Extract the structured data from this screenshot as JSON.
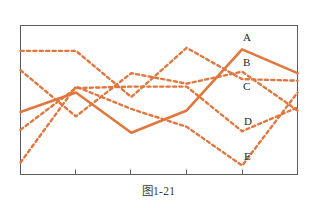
{
  "figure": {
    "caption": "图1-21",
    "line_color": "#e0773e",
    "frame_color": "#5a5a66",
    "background": "#ffffff"
  },
  "chart_data": {
    "type": "line",
    "title": "",
    "subtitle": "",
    "xlabel": "",
    "ylabel": "",
    "grid": false,
    "legend_position": "inline-right",
    "axis_frame": true,
    "xlim": [
      0,
      5
    ],
    "ylim": [
      0,
      10
    ],
    "x": [
      0,
      1,
      2,
      3,
      4,
      5
    ],
    "xtick_labels": [
      "",
      "",
      "",
      "",
      "",
      ""
    ],
    "ytick_labels": [],
    "annotations": [
      {
        "text": "A",
        "x": 4.05,
        "y": 9.1
      },
      {
        "text": "B",
        "x": 4.05,
        "y": 7.4
      },
      {
        "text": "C",
        "x": 4.05,
        "y": 5.8
      },
      {
        "text": "D",
        "x": 4.1,
        "y": 3.5
      },
      {
        "text": "E",
        "x": 4.1,
        "y": 1.1
      }
    ],
    "series": [
      {
        "name": "A",
        "style": "solid",
        "label": "A",
        "color": "#e0773e",
        "values": [
          4.2,
          5.5,
          2.8,
          4.3,
          8.4,
          6.8
        ]
      },
      {
        "name": "B",
        "style": "dashed",
        "label": "B",
        "color": "#e0773e",
        "values": [
          8.3,
          8.3,
          5.2,
          8.5,
          6.4,
          6.3
        ]
      },
      {
        "name": "C",
        "style": "dashed",
        "label": "C",
        "color": "#e0773e",
        "values": [
          7.0,
          3.9,
          6.8,
          6.1,
          6.9,
          4.3
        ]
      },
      {
        "name": "D",
        "style": "dashed",
        "label": "D",
        "color": "#e0773e",
        "values": [
          3.0,
          5.8,
          5.9,
          5.9,
          2.9,
          4.5
        ]
      },
      {
        "name": "E",
        "style": "dashed",
        "label": "E",
        "color": "#e0773e",
        "values": [
          0.8,
          5.9,
          4.4,
          3.2,
          0.6,
          5.5
        ]
      }
    ]
  }
}
